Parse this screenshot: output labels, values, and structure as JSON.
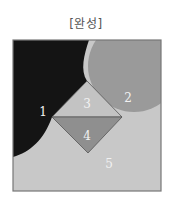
{
  "title": "[완성]",
  "figure": {
    "square": {
      "x": 13,
      "y": 40,
      "width": 148,
      "height": 151,
      "border_color": "#777777"
    },
    "regions": [
      {
        "id": "1",
        "label": "1",
        "color": "#141414",
        "label_pos": [
          43,
          112
        ]
      },
      {
        "id": "2",
        "label": "2",
        "color": "#9a9a9a",
        "label_pos": [
          128,
          98
        ]
      },
      {
        "id": "3",
        "label": "3",
        "color": "#c3c3c3",
        "label_pos": [
          87,
          104
        ]
      },
      {
        "id": "4",
        "label": "4",
        "color": "#8f8f8f",
        "label_pos": [
          87,
          136
        ]
      },
      {
        "id": "5",
        "label": "5",
        "color": "#c8c8c8",
        "label_pos": [
          109,
          164
        ]
      }
    ]
  }
}
